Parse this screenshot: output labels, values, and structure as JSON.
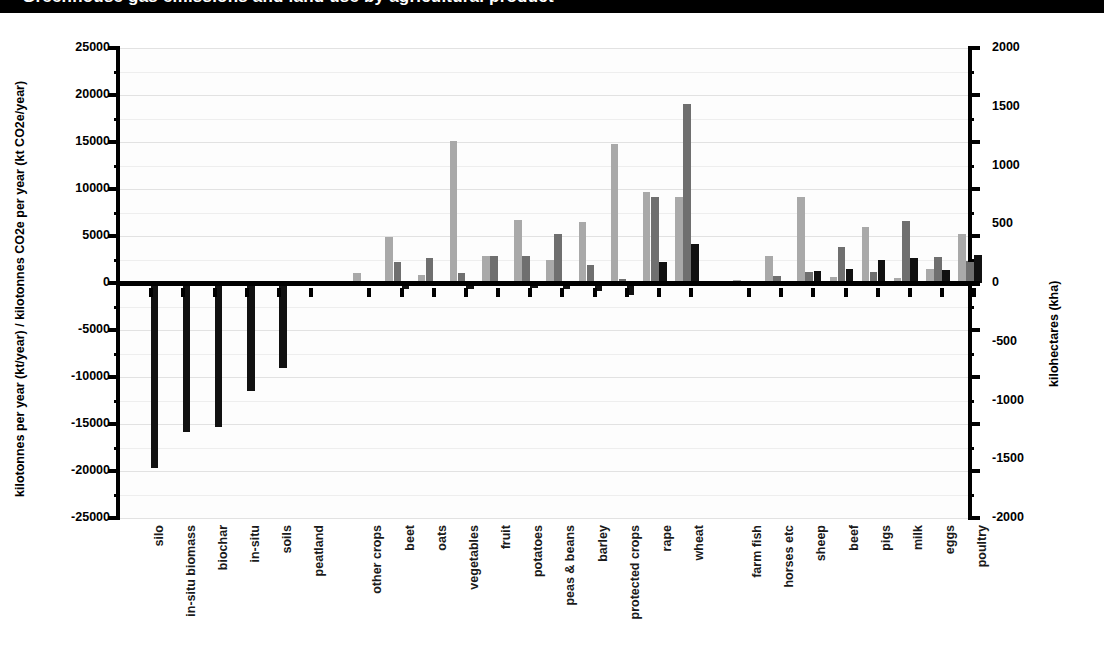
{
  "title_bar": {
    "text": "Greenhouse gas emissions and land use by agricultural product"
  },
  "chart_data": {
    "type": "bar",
    "title": "",
    "subtitle": "",
    "xlabel": "",
    "ylabel": "kilotonnes per year (kt/year) / kilotonnes CO2e per year (kt CO2e/year)",
    "y2label": "kilohectares (kha)",
    "ylim": [
      -25000,
      25000
    ],
    "y2lim": [
      -2000,
      2000
    ],
    "ytick_step": 5000,
    "y2tick_step": 500,
    "ytick_labels": [
      "25000",
      "20000",
      "15000",
      "10000",
      "5000",
      "0",
      "-5000",
      "-10000",
      "-15000",
      "-20000",
      "-25000"
    ],
    "y2tick_labels": [
      "2000",
      "1500",
      "1000",
      "500",
      "0",
      "-500",
      "-1000",
      "-1500",
      "-2000"
    ],
    "grid": true,
    "legend": "none",
    "minor_gridlines": true,
    "categories": [
      "silo",
      "in-situ biomass",
      "biochar",
      "in-situ",
      "soils",
      "peatland",
      "other crops",
      "beet",
      "oats",
      "vegetables",
      "fruit",
      "potatoes",
      "peas & beans",
      "barley",
      "protected crops",
      "rape",
      "wheat",
      "farm fish",
      "horses etc",
      "sheep",
      "beef",
      "pigs",
      "milk",
      "eggs",
      "poultry"
    ],
    "gaps_after": [
      "peatland",
      "wheat"
    ],
    "series": [
      {
        "name": "series-light",
        "color": "#a9a9a9",
        "values": [
          0,
          0,
          0,
          0,
          0,
          0,
          1100,
          4900,
          900,
          15100,
          2900,
          6700,
          2400,
          6500,
          14800,
          9700,
          9100,
          300,
          2900,
          9200,
          600,
          6000,
          500,
          1500,
          5200
        ]
      },
      {
        "name": "series-medium",
        "color": "#6f6f6f",
        "values": [
          0,
          0,
          0,
          0,
          0,
          0,
          200,
          2200,
          2700,
          1100,
          2900,
          2900,
          5200,
          1900,
          400,
          9100,
          19000,
          100,
          700,
          1200,
          3800,
          1200,
          6600,
          2800,
          2300
        ]
      },
      {
        "name": "series-dark",
        "color": "#111111",
        "values": [
          -19700,
          -15800,
          -15300,
          -11500,
          -9000,
          -100,
          -300,
          -600,
          -300,
          -600,
          -300,
          -500,
          -600,
          -900,
          -1300,
          2200,
          4100,
          -100,
          -300,
          1300,
          1500,
          2500,
          2700,
          1400,
          3000
        ]
      }
    ],
    "negative_note": "silo, in-situ biomass, biochar, in-situ and soils are strongly negative (dark series only)"
  }
}
